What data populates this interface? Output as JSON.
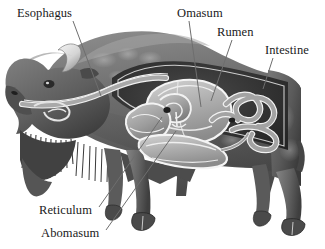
{
  "figure": {
    "background_color": "#ffffff",
    "width": 325,
    "height": 249,
    "style": "grayscale shaded anatomical illustration with cutaway torso"
  },
  "palette": {
    "background": "#ffffff",
    "label_text": "#1a1a1a",
    "leader_line": "#6e6e6e",
    "body_dark": "#3d3d3d",
    "body_mid": "#6a6a6a",
    "body_light": "#9a9a9a",
    "cavity_dark": "#2f2f2f",
    "organ_fill": "#a8a8a8",
    "organ_light": "#c8c8c8",
    "organ_outline": "#f2f2f2",
    "hoof": "#4a4a4a",
    "horn": "#e8e8e8"
  },
  "labels": [
    {
      "id": "esophagus",
      "text": "Esophagus",
      "position": "top-left",
      "leader": {
        "x1": 73,
        "y1": 21,
        "x2": 101,
        "y2": 96
      }
    },
    {
      "id": "omasum",
      "text": "Omasum",
      "position": "top-center",
      "leader": {
        "x1": 189,
        "y1": 21,
        "x2": 201,
        "y2": 107
      }
    },
    {
      "id": "rumen",
      "text": "Rumen",
      "position": "top-right",
      "leader": {
        "x1": 232,
        "y1": 40,
        "x2": 211,
        "y2": 101
      }
    },
    {
      "id": "intestine",
      "text": "Intestine",
      "position": "right",
      "leader": {
        "x1": 273,
        "y1": 58,
        "x2": 263,
        "y2": 89
      }
    },
    {
      "id": "reticulum",
      "text": "Reticulum",
      "position": "bottom-left",
      "leader": {
        "x1": 99,
        "y1": 207,
        "x2": 162,
        "y2": 117
      }
    },
    {
      "id": "abomasum",
      "text": "Abomasum",
      "position": "bottom-left",
      "leader": {
        "x1": 106,
        "y1": 230,
        "x2": 176,
        "y2": 131
      }
    }
  ],
  "anatomy_parts": [
    "esophagus",
    "omasum",
    "rumen",
    "intestine",
    "reticulum",
    "abomasum"
  ]
}
